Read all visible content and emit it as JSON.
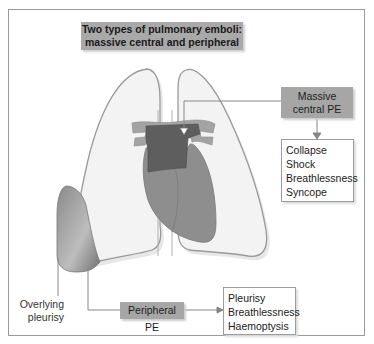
{
  "title": {
    "line1": "Two types of pulmonary emboli:",
    "line2": "massive central and peripheral"
  },
  "central": {
    "label_line1": "Massive",
    "label_line2": "central PE",
    "effects": [
      "Collapse",
      "Shock",
      "Breathlessness",
      "Syncope"
    ]
  },
  "peripheral": {
    "label": "Peripheral PE",
    "effects": [
      "Pleurisy",
      "Breathlessness",
      "Haemoptysis"
    ]
  },
  "annotation": {
    "line1": "Overlying",
    "line2": "pleurisy"
  },
  "colors": {
    "lung_fill": "#f3f3f3",
    "lung_outline": "#9a9a9a",
    "heart_fill": "#8e8e8e",
    "embolus_fill": "#5e5e5e",
    "vessel_fill": "#a3a3a3",
    "label_fill": "#a6a6a6",
    "connector": "#888888"
  }
}
